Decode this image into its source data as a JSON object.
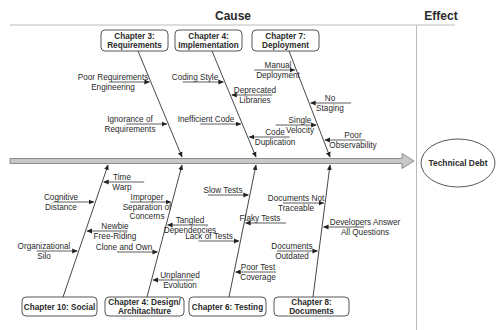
{
  "headers": {
    "cause": "Cause",
    "effect": "Effect"
  },
  "effect": {
    "label": "Technical Debt"
  },
  "colors": {
    "spine_fill": "#c8c8c8",
    "spine_stroke": "#777777",
    "line": "#333333",
    "box_border": "#444444",
    "divider": "#bbbbbb"
  },
  "categories_top": [
    {
      "name": "requirements",
      "lines": [
        "Chapter 3:",
        "Requirements"
      ],
      "box": [
        101,
        30,
        67,
        21
      ],
      "bone": [
        138,
        51,
        182,
        157
      ],
      "causes": [
        {
          "lines": [
            "Poor Requirements",
            "Engineering"
          ],
          "side": "left",
          "y": 82,
          "tx": 113
        },
        {
          "lines": [
            "Ignorance of",
            "Requirements"
          ],
          "side": "left",
          "y": 124,
          "tx": 130
        }
      ]
    },
    {
      "name": "implementation",
      "lines": [
        "Chapter 4:",
        "Implementation"
      ],
      "box": [
        175,
        30,
        67,
        21
      ],
      "bone": [
        212,
        51,
        256,
        157
      ],
      "causes": [
        {
          "lines": [
            "Coding Style"
          ],
          "side": "left",
          "y": 82,
          "tx": 195
        },
        {
          "lines": [
            "Deprecated",
            "Libraries"
          ],
          "side": "right",
          "y": 95,
          "tx": 255
        },
        {
          "lines": [
            "Inefficient Code"
          ],
          "side": "left",
          "y": 124,
          "tx": 206
        },
        {
          "lines": [
            "Code",
            "Duplication"
          ],
          "side": "right",
          "y": 137,
          "tx": 275
        }
      ]
    },
    {
      "name": "deployment",
      "lines": [
        "Chapter 7:",
        "Deployment"
      ],
      "box": [
        252,
        30,
        67,
        21
      ],
      "bone": [
        289,
        51,
        330,
        157
      ],
      "causes": [
        {
          "lines": [
            "Manual",
            "Deployment"
          ],
          "side": "left",
          "y": 70,
          "tx": 278
        },
        {
          "lines": [
            "No",
            "Staging"
          ],
          "side": "right",
          "y": 103,
          "tx": 330
        },
        {
          "lines": [
            "Single",
            "Velocity"
          ],
          "side": "left",
          "y": 125,
          "tx": 300
        },
        {
          "lines": [
            "Poor",
            "Observability"
          ],
          "side": "right",
          "y": 140,
          "tx": 353
        }
      ]
    }
  ],
  "categories_bottom": [
    {
      "name": "social",
      "lines": [
        "Chapter 10: Social"
      ],
      "box": [
        22,
        297,
        75,
        19
      ],
      "bone": [
        63,
        297,
        108,
        165
      ],
      "causes": [
        {
          "lines": [
            "Time",
            "Warp"
          ],
          "side": "right",
          "y": 182,
          "tx": 122
        },
        {
          "lines": [
            "Cognitive",
            "Distance"
          ],
          "side": "left",
          "y": 202,
          "tx": 61
        },
        {
          "lines": [
            "Newbie",
            "Free-Riding"
          ],
          "side": "right",
          "y": 231,
          "tx": 115
        },
        {
          "lines": [
            "Organizational",
            "Silo"
          ],
          "side": "left",
          "y": 251,
          "tx": 44
        }
      ]
    },
    {
      "name": "design",
      "lines": [
        "Chapter 4: Design/",
        "Architachture"
      ],
      "box": [
        105,
        297,
        79,
        19
      ],
      "bone": [
        147,
        297,
        182,
        165
      ],
      "causes": [
        {
          "lines": [
            "Improper",
            "Separation of",
            "Concerns"
          ],
          "side": "left",
          "y": 202,
          "tx": 147
        },
        {
          "lines": [
            "Tangled",
            "Dependencies"
          ],
          "side": "right",
          "y": 225,
          "tx": 190
        },
        {
          "lines": [
            "Clone and Own"
          ],
          "side": "left",
          "y": 252,
          "tx": 124
        },
        {
          "lines": [
            "Unplanned",
            "Evolution"
          ],
          "side": "right",
          "y": 280,
          "tx": 180
        }
      ]
    },
    {
      "name": "testing",
      "lines": [
        "Chapter 6: Testing"
      ],
      "box": [
        189,
        297,
        77,
        19
      ],
      "bone": [
        229,
        297,
        256,
        165
      ],
      "causes": [
        {
          "lines": [
            "Slow Tests"
          ],
          "side": "left",
          "y": 195,
          "tx": 223
        },
        {
          "lines": [
            "Flaky Tests"
          ],
          "side": "right",
          "y": 223,
          "tx": 260
        },
        {
          "lines": [
            "Lack of Tests"
          ],
          "side": "left",
          "y": 241,
          "tx": 209
        },
        {
          "lines": [
            "Poor Test",
            "Coverage"
          ],
          "side": "right",
          "y": 272,
          "tx": 258
        }
      ]
    },
    {
      "name": "documents",
      "lines": [
        "Chapter 8:",
        "Documents"
      ],
      "box": [
        274,
        297,
        75,
        19
      ],
      "bone": [
        313,
        297,
        330,
        165
      ],
      "causes": [
        {
          "lines": [
            "Documents Not",
            "Traceable"
          ],
          "side": "left",
          "y": 203,
          "tx": 296
        },
        {
          "lines": [
            "Developers Answer",
            "All Questions"
          ],
          "side": "right",
          "y": 227,
          "tx": 365
        },
        {
          "lines": [
            "Documents",
            "Outdated"
          ],
          "side": "left",
          "y": 251,
          "tx": 292
        }
      ]
    }
  ]
}
